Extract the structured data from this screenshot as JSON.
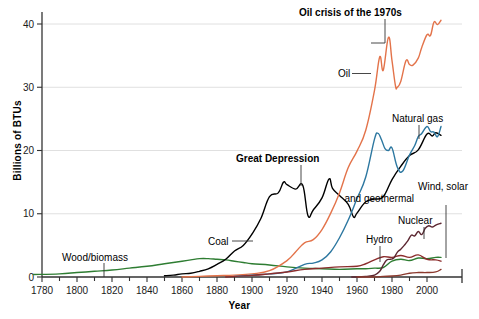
{
  "chart_data": {
    "type": "line",
    "title": "",
    "xlabel": "Year",
    "ylabel": "Billions of BTUs",
    "xlim": [
      1775,
      2010
    ],
    "ylim": [
      0,
      42
    ],
    "xticks": [
      1780,
      1800,
      1820,
      1840,
      1860,
      1880,
      1900,
      1920,
      1940,
      1960,
      1980,
      2000
    ],
    "yticks": [
      0,
      10,
      20,
      30,
      40
    ],
    "grid": "horizontal",
    "legend_position": "inline-annotations",
    "series": [
      {
        "name": "Wood/biomass",
        "color": "#2E7D32",
        "label_x": 1790,
        "label_y": 5.6,
        "x": [
          1775,
          1790,
          1800,
          1810,
          1820,
          1830,
          1840,
          1850,
          1860,
          1865,
          1870,
          1875,
          1880,
          1885,
          1890,
          1895,
          1900,
          1910,
          1920,
          1930,
          1940,
          1950,
          1960,
          1965,
          1970,
          1975,
          1980,
          1985,
          1990,
          1995,
          2000,
          2005,
          2008
        ],
        "values": [
          0.4,
          0.5,
          0.7,
          0.9,
          1.1,
          1.4,
          1.7,
          2.1,
          2.5,
          2.7,
          2.9,
          2.9,
          2.8,
          2.7,
          2.5,
          2.3,
          2.1,
          1.9,
          1.6,
          1.4,
          1.3,
          1.2,
          1.3,
          1.3,
          1.4,
          1.5,
          2.5,
          2.8,
          2.6,
          3.0,
          2.9,
          3.1,
          3.1
        ]
      },
      {
        "name": "Coal",
        "color": "#000000",
        "label_x": 1888,
        "label_y": 6.0,
        "x": [
          1850,
          1855,
          1860,
          1865,
          1870,
          1875,
          1880,
          1885,
          1890,
          1895,
          1900,
          1905,
          1910,
          1915,
          1918,
          1920,
          1925,
          1929,
          1932,
          1935,
          1940,
          1944,
          1946,
          1950,
          1955,
          1958,
          1960,
          1965,
          1970,
          1975,
          1980,
          1985,
          1990,
          1995,
          2000,
          2003,
          2005,
          2008
        ],
        "values": [
          0.2,
          0.3,
          0.5,
          0.6,
          0.9,
          1.3,
          2.0,
          2.8,
          4.1,
          5.0,
          6.8,
          9.2,
          12.7,
          13.3,
          15.0,
          14.6,
          13.9,
          14.5,
          9.7,
          10.6,
          12.5,
          15.5,
          14.0,
          12.9,
          11.5,
          9.5,
          10.1,
          11.9,
          12.3,
          12.7,
          15.4,
          17.5,
          19.2,
          20.1,
          22.6,
          22.3,
          22.8,
          22.4
        ]
      },
      {
        "name": "Oil",
        "color": "#E3734A",
        "label_x": 1948,
        "label_y": 27.5,
        "x": [
          1860,
          1870,
          1880,
          1890,
          1900,
          1910,
          1920,
          1925,
          1930,
          1935,
          1940,
          1945,
          1950,
          1955,
          1960,
          1965,
          1970,
          1973,
          1975,
          1978,
          1980,
          1982,
          1983,
          1985,
          1988,
          1990,
          1992,
          1995,
          1997,
          2000,
          2002,
          2004,
          2006,
          2008
        ],
        "values": [
          0.0,
          0.1,
          0.2,
          0.3,
          0.5,
          1.0,
          2.6,
          4.0,
          5.4,
          5.9,
          7.5,
          10.1,
          13.3,
          17.3,
          19.9,
          23.2,
          29.5,
          34.8,
          32.7,
          37.9,
          34.2,
          30.2,
          30.0,
          30.9,
          34.2,
          33.6,
          33.5,
          34.6,
          36.3,
          38.3,
          38.2,
          40.3,
          39.9,
          40.6
        ]
      },
      {
        "name": "Natural gas",
        "color": "#2C77A0",
        "label_x": 1975,
        "label_y": 25.5,
        "x": [
          1890,
          1900,
          1910,
          1920,
          1930,
          1935,
          1940,
          1945,
          1950,
          1955,
          1960,
          1965,
          1970,
          1972,
          1974,
          1976,
          1978,
          1980,
          1983,
          1986,
          1990,
          1993,
          1995,
          1997,
          2000,
          2002,
          2004,
          2006,
          2008
        ],
        "values": [
          0.1,
          0.3,
          0.5,
          0.8,
          2.0,
          2.2,
          2.7,
          4.0,
          6.2,
          9.0,
          12.4,
          15.8,
          21.8,
          22.7,
          21.7,
          20.3,
          20.0,
          20.4,
          17.4,
          16.7,
          19.3,
          20.8,
          22.2,
          22.7,
          23.8,
          23.0,
          22.9,
          22.2,
          23.8
        ]
      },
      {
        "name": "Hydro",
        "color": "#8C2D2D",
        "label_x": 1967,
        "label_y": 6.4,
        "x": [
          1885,
          1900,
          1910,
          1920,
          1930,
          1940,
          1950,
          1960,
          1965,
          1970,
          1975,
          1980,
          1985,
          1990,
          1995,
          2000,
          2005,
          2008
        ],
        "values": [
          0.0,
          0.25,
          0.5,
          0.8,
          1.2,
          1.4,
          1.6,
          1.7,
          2.1,
          2.7,
          3.2,
          3.1,
          3.4,
          3.1,
          3.5,
          2.8,
          2.7,
          2.5
        ]
      },
      {
        "name": "Nuclear",
        "color": "#5B2630",
        "label_x": 1983,
        "label_y": 8.2,
        "x": [
          1957,
          1960,
          1965,
          1970,
          1973,
          1975,
          1977,
          1979,
          1981,
          1983,
          1985,
          1987,
          1989,
          1991,
          1993,
          1995,
          1997,
          1999,
          2001,
          2003,
          2005,
          2008
        ],
        "values": [
          0.0,
          0.0,
          0.1,
          0.3,
          0.9,
          1.9,
          2.7,
          2.8,
          3.0,
          3.9,
          4.4,
          5.0,
          5.7,
          6.6,
          6.5,
          7.2,
          6.7,
          7.7,
          8.1,
          7.9,
          8.2,
          8.5
        ]
      },
      {
        "name": "Wind, solar and geothermal",
        "color": "#8C3A2E",
        "label_x": 1988,
        "label_y": 13.0,
        "x": [
          1960,
          1970,
          1975,
          1980,
          1985,
          1990,
          1995,
          2000,
          2005,
          2008
        ],
        "values": [
          0.0,
          0.0,
          0.1,
          0.15,
          0.3,
          0.6,
          0.7,
          0.7,
          0.8,
          1.2
        ]
      }
    ],
    "annotations": [
      {
        "text": "Oil crisis of the 1970s",
        "x": 1977,
        "y": 43.5,
        "bold": true
      },
      {
        "text": "Great Depression",
        "x": 1921,
        "y": 18.5,
        "bold": true
      }
    ]
  },
  "labels": {
    "wood_biomass": "Wood/biomass",
    "coal": "Coal",
    "oil": "Oil",
    "natural_gas": "Natural gas",
    "hydro": "Hydro",
    "nuclear": "Nuclear",
    "wind_solar_line1": "Wind, solar",
    "wind_solar_line2": "and geothermal",
    "oil_crisis": "Oil crisis of the 1970s",
    "great_depression": "Great Depression",
    "xlabel": "Year",
    "ylabel": "Billions of BTUs"
  },
  "ticks": {
    "x": [
      "1780",
      "1800",
      "1820",
      "1840",
      "1860",
      "1880",
      "1900",
      "1920",
      "1940",
      "1960",
      "1980",
      "2000"
    ],
    "y": [
      "0",
      "10",
      "20",
      "30",
      "40"
    ]
  },
  "colors": {
    "wood_biomass": "#2E7D32",
    "coal": "#000000",
    "oil": "#E3734A",
    "natural_gas": "#2C77A0",
    "hydro": "#8C2D2D",
    "nuclear": "#5B2630",
    "wind_solar": "#8C3A2E",
    "grid": "#d8d8d8",
    "axis": "#333333"
  }
}
